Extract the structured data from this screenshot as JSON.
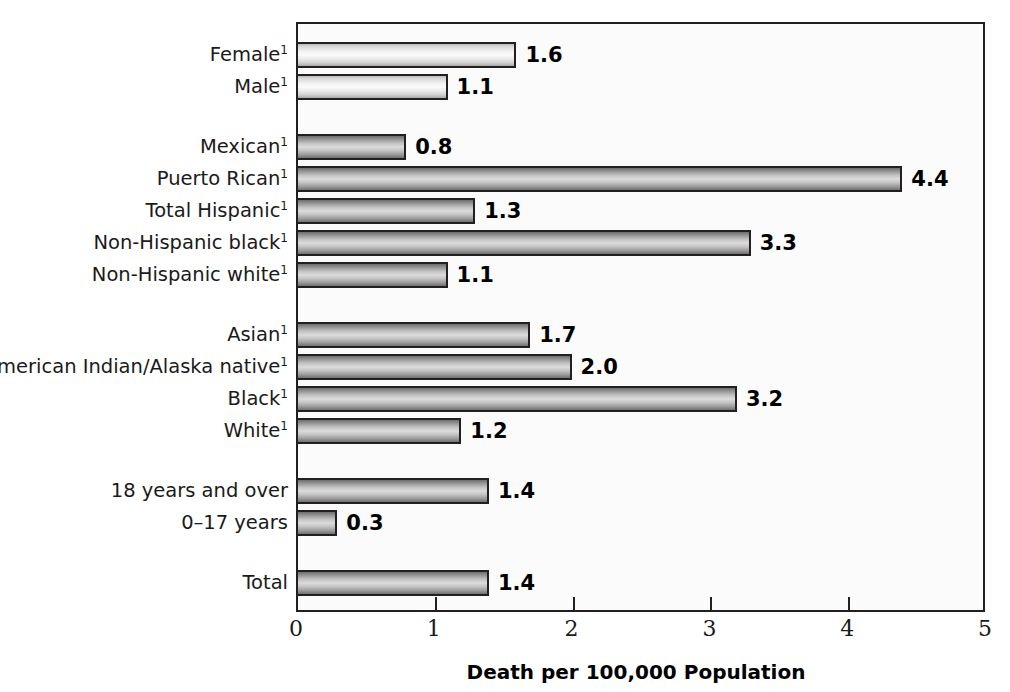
{
  "chart_data": {
    "type": "bar",
    "orientation": "horizontal",
    "title": "",
    "xlabel": "Death per 100,000 Population",
    "ylabel": "",
    "xlim": [
      0,
      5
    ],
    "xticks": [
      "0",
      "1",
      "2",
      "3",
      "4",
      "5"
    ],
    "grid": false,
    "legend": null,
    "footnote_marker": "1",
    "groups": [
      {
        "name": "sex",
        "shade": "light",
        "bars": [
          {
            "label": "Female",
            "footnote": "1",
            "value": 1.6,
            "value_label": "1.6"
          },
          {
            "label": "Male",
            "footnote": "1",
            "value": 1.1,
            "value_label": "1.1"
          }
        ]
      },
      {
        "name": "hispanic-origin",
        "shade": "dark",
        "bars": [
          {
            "label": "Mexican",
            "footnote": "1",
            "value": 0.8,
            "value_label": "0.8"
          },
          {
            "label": "Puerto Rican",
            "footnote": "1",
            "value": 4.4,
            "value_label": "4.4"
          },
          {
            "label": "Total Hispanic",
            "footnote": "1",
            "value": 1.3,
            "value_label": "1.3"
          },
          {
            "label": "Non-Hispanic black",
            "footnote": "1",
            "value": 3.3,
            "value_label": "3.3"
          },
          {
            "label": "Non-Hispanic white",
            "footnote": "1",
            "value": 1.1,
            "value_label": "1.1"
          }
        ]
      },
      {
        "name": "race",
        "shade": "dark",
        "bars": [
          {
            "label": "Asian",
            "footnote": "1",
            "value": 1.7,
            "value_label": "1.7"
          },
          {
            "label": "American Indian/Alaska native",
            "footnote": "1",
            "value": 2.0,
            "value_label": "2.0"
          },
          {
            "label": "Black",
            "footnote": "1",
            "value": 3.2,
            "value_label": "3.2"
          },
          {
            "label": "White",
            "footnote": "1",
            "value": 1.2,
            "value_label": "1.2"
          }
        ]
      },
      {
        "name": "age",
        "shade": "dark",
        "bars": [
          {
            "label": "18 years and over",
            "footnote": "",
            "value": 1.4,
            "value_label": "1.4"
          },
          {
            "label": "0–17 years",
            "footnote": "",
            "value": 0.3,
            "value_label": "0.3"
          }
        ]
      },
      {
        "name": "total",
        "shade": "dark",
        "bars": [
          {
            "label": "Total",
            "footnote": "",
            "value": 1.4,
            "value_label": "1.4"
          }
        ]
      }
    ],
    "categories": [
      "Female",
      "Male",
      "Mexican",
      "Puerto Rican",
      "Total Hispanic",
      "Non-Hispanic black",
      "Non-Hispanic white",
      "Asian",
      "American Indian/Alaska native",
      "Black",
      "White",
      "18 years and over",
      "0–17 years",
      "Total"
    ],
    "values": [
      1.6,
      1.1,
      0.8,
      4.4,
      1.3,
      3.3,
      1.1,
      1.7,
      2.0,
      3.2,
      1.2,
      1.4,
      0.3,
      1.4
    ],
    "colors": {
      "axis": "#231f20",
      "bar_light": "#ededed",
      "bar_dark": "#b4b4b4",
      "text": "#1a1a1a",
      "background": "#ffffff"
    }
  }
}
